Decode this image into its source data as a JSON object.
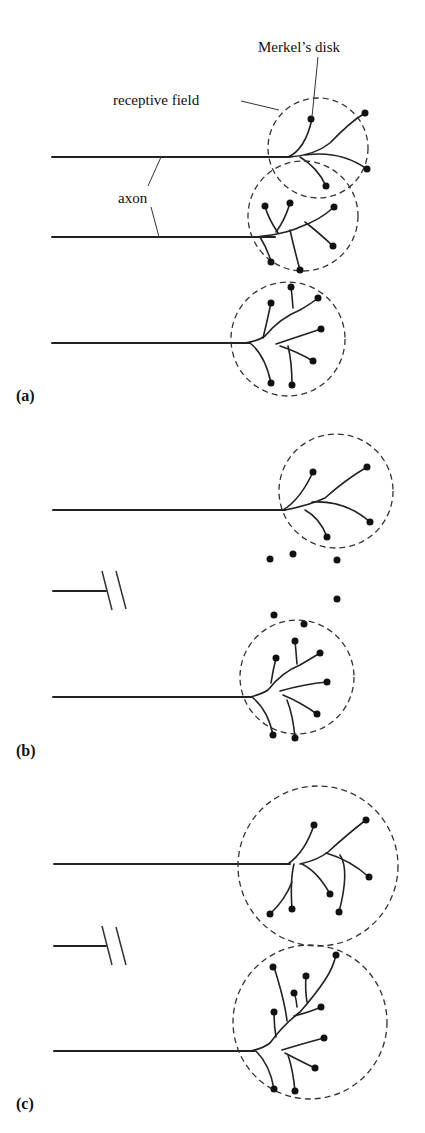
{
  "labels": {
    "merkels_disk": "Merkel’s disk",
    "receptive_field": "receptive field",
    "axon": "axon",
    "panel_a": "(a)",
    "panel_b": "(b)",
    "panel_c": "(c)"
  },
  "colors": {
    "ink": "#222222",
    "background": "#ffffff"
  },
  "panels": [
    {
      "id": "a",
      "description": "Three intact axons, each with its own receptive field of Merkel's disks",
      "units": [
        {
          "axon_y": 157,
          "axon_x0": 52,
          "axon_x1": 290,
          "field": {
            "cx": 318,
            "cy": 148,
            "r": 50
          }
        },
        {
          "axon_y": 237,
          "axon_x0": 52,
          "axon_x1": 275,
          "field": {
            "cx": 303,
            "cy": 216,
            "r": 55
          }
        },
        {
          "axon_y": 343,
          "axon_x0": 52,
          "axon_x1": 250,
          "field": {
            "cx": 288,
            "cy": 339,
            "r": 57
          }
        }
      ]
    },
    {
      "id": "b",
      "description": "Middle axon severed; its Merkel's disks are left denervated",
      "units": [
        {
          "axon_y": 510,
          "axon_x0": 53,
          "axon_x1": 285,
          "field": {
            "cx": 336,
            "cy": 491,
            "r": 57
          }
        },
        {
          "axon_y": 697,
          "axon_x0": 53,
          "axon_x1": 252,
          "field": {
            "cx": 297,
            "cy": 677,
            "r": 57
          }
        }
      ],
      "cut_axon": {
        "y": 591,
        "x0": 52,
        "x1": 106
      },
      "denervated_disks": 6
    },
    {
      "id": "c",
      "description": "Remaining axons sprout to innervate the denervated disks; receptive fields enlarge",
      "units": [
        {
          "axon_y": 864,
          "axon_x0": 54,
          "axon_x1": 290,
          "field": {
            "cx": 318,
            "cy": 866,
            "r": 80
          }
        },
        {
          "axon_y": 1051,
          "axon_x0": 54,
          "axon_x1": 255,
          "field": {
            "cx": 310,
            "cy": 1022,
            "r": 77
          }
        }
      ],
      "cut_axon": {
        "y": 946,
        "x0": 54,
        "x1": 106
      }
    }
  ]
}
